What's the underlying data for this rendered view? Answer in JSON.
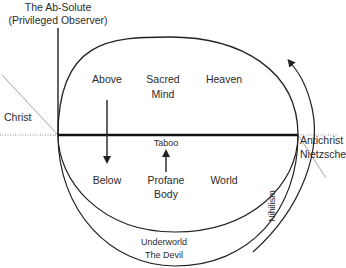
{
  "diagram": {
    "top_label": {
      "line1": "The Ab-Solute",
      "line2": "(Privileged Observer)"
    },
    "side_labels": {
      "left": "Christ",
      "right_line1": "Antichrist",
      "right_line2": "Nietzsche"
    },
    "upper_row": {
      "left": "Above",
      "center_line1": "Sacred",
      "center_line2": "Mind",
      "right": "Heaven"
    },
    "divider_label": "Taboo",
    "lower_row": {
      "left": "Below",
      "center_line1": "Profane",
      "center_line2": "Body",
      "right": "World"
    },
    "bottom_label": {
      "line1": "Underworld",
      "line2": "The Devil"
    },
    "arc_label": "Nihilism",
    "colors": {
      "stroke": "#222222",
      "text": "#2b2b2b",
      "dotted": "#888888"
    }
  }
}
